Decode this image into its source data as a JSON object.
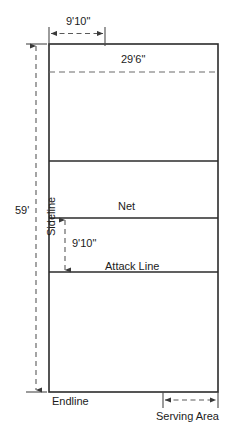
{
  "diagram": {
    "type": "volleyball-court-diagram",
    "colors": {
      "line": "#2b2b2b",
      "dimension_line": "#555555",
      "text": "#1b1b1b",
      "court_fill": "#ffffff",
      "background": "#ffffff"
    },
    "court_lines": {
      "net_label": "Net",
      "attack_line_label": "Attack Line",
      "endline_label": "Endline",
      "sideline_label": "Sideline",
      "serving_area_label": "Serving Area"
    },
    "dimensions": {
      "attack_zone_top_width": "9'10\"",
      "court_width": "29'6\"",
      "attack_zone_depth": "9'10\"",
      "court_length": "59'"
    }
  }
}
